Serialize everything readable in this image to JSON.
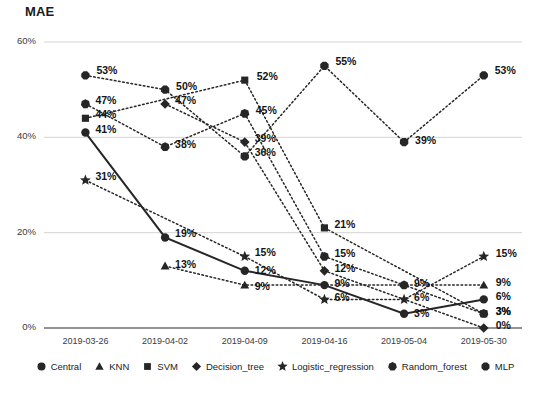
{
  "chart": {
    "title": "MAE",
    "type": "line"
  },
  "chart_data": {
    "type": "line",
    "title": "MAE",
    "xlabel": "",
    "ylabel": "MAE",
    "ylim": [
      0,
      60
    ],
    "yticks": [
      "0%",
      "20%",
      "40%",
      "60%"
    ],
    "ytick_values": [
      0,
      20,
      40,
      60
    ],
    "grid": true,
    "legend_position": "bottom",
    "value_labels": true,
    "value_label_suffix": "%",
    "categories": [
      "2019-03-26",
      "2019-04-02",
      "2019-04-09",
      "2019-04-16",
      "2019-05-04",
      "2019-05-30"
    ],
    "series": [
      {
        "name": "Central",
        "marker": "circle",
        "line": "solid",
        "values": [
          41,
          19,
          12,
          9,
          3,
          6
        ]
      },
      {
        "name": "KNN",
        "marker": "triangle",
        "line": "dotted",
        "values": [
          null,
          13,
          9,
          null,
          null,
          9
        ]
      },
      {
        "name": "SVM",
        "marker": "square",
        "line": "dotted",
        "values": [
          44,
          null,
          52,
          21,
          null,
          3
        ]
      },
      {
        "name": "Decision_tree",
        "marker": "diamond",
        "line": "dotted",
        "values": [
          null,
          47,
          39,
          12,
          null,
          0
        ]
      },
      {
        "name": "Logistic_regression",
        "marker": "star",
        "line": "dotted",
        "values": [
          31,
          null,
          15,
          6,
          6,
          15
        ]
      },
      {
        "name": "Random_forest",
        "marker": "heptagon",
        "line": "dotted",
        "values": [
          47,
          38,
          45,
          15,
          9,
          3
        ]
      },
      {
        "name": "MLP",
        "marker": "octagon",
        "line": "dotted",
        "values": [
          53,
          50,
          36,
          55,
          39,
          53
        ]
      }
    ]
  },
  "legend": {
    "items": [
      {
        "label": "Central",
        "marker": "circle"
      },
      {
        "label": "KNN",
        "marker": "triangle"
      },
      {
        "label": "SVM",
        "marker": "square"
      },
      {
        "label": "Decision_tree",
        "marker": "diamond"
      },
      {
        "label": "Logistic_regression",
        "marker": "star"
      },
      {
        "label": "Random_forest",
        "marker": "heptagon"
      },
      {
        "label": "MLP",
        "marker": "octagon"
      }
    ]
  },
  "colors": {
    "series": "#262626",
    "grid": "#d4d4d4",
    "axis": "#6f6f6f",
    "text": "#1b1b1b"
  }
}
